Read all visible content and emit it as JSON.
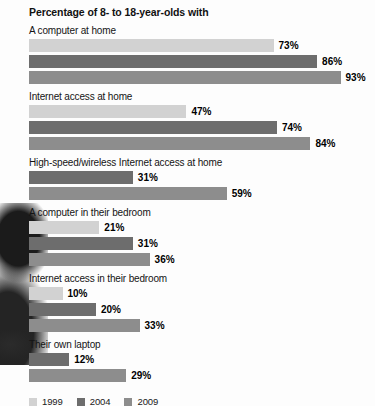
{
  "chart_data": {
    "type": "bar",
    "orientation": "horizontal",
    "title": "Percentage of 8- to 18-year-olds with",
    "xlabel": "",
    "ylabel": "",
    "xlim": [
      0,
      100
    ],
    "grid": false,
    "legend_position": "bottom-left",
    "categories": [
      "A computer at home",
      "Internet access at home",
      "High-speed/wireless Internet access at home",
      "A computer in their bedroom",
      "Internet access in their bedroom",
      "Their own laptop"
    ],
    "series": [
      {
        "name": "1999",
        "color": "#d2d2d2",
        "values": [
          73,
          47,
          null,
          21,
          10,
          null
        ]
      },
      {
        "name": "2004",
        "color": "#6d6d6d",
        "values": [
          86,
          74,
          31,
          31,
          20,
          12
        ]
      },
      {
        "name": "2009",
        "color": "#8d8d8d",
        "values": [
          93,
          84,
          59,
          36,
          33,
          29
        ]
      }
    ],
    "value_suffix": "%",
    "groups": [
      {
        "label": "A computer at home",
        "bars": [
          {
            "series": "1999",
            "value": 73,
            "label": "73%",
            "color": "#d2d2d2"
          },
          {
            "series": "2004",
            "value": 86,
            "label": "86%",
            "color": "#6d6d6d"
          },
          {
            "series": "2009",
            "value": 93,
            "label": "93%",
            "color": "#8d8d8d"
          }
        ]
      },
      {
        "label": "Internet access at home",
        "bars": [
          {
            "series": "1999",
            "value": 47,
            "label": "47%",
            "color": "#d2d2d2"
          },
          {
            "series": "2004",
            "value": 74,
            "label": "74%",
            "color": "#6d6d6d"
          },
          {
            "series": "2009",
            "value": 84,
            "label": "84%",
            "color": "#8d8d8d"
          }
        ]
      },
      {
        "label": "High-speed/wireless Internet access at home",
        "bars": [
          {
            "series": "2004",
            "value": 31,
            "label": "31%",
            "color": "#6d6d6d"
          },
          {
            "series": "2009",
            "value": 59,
            "label": "59%",
            "color": "#8d8d8d"
          }
        ]
      },
      {
        "label": "A computer in their bedroom",
        "bars": [
          {
            "series": "1999",
            "value": 21,
            "label": "21%",
            "color": "#d2d2d2"
          },
          {
            "series": "2004",
            "value": 31,
            "label": "31%",
            "color": "#6d6d6d"
          },
          {
            "series": "2009",
            "value": 36,
            "label": "36%",
            "color": "#8d8d8d"
          }
        ]
      },
      {
        "label": "Internet access in their bedroom",
        "bars": [
          {
            "series": "1999",
            "value": 10,
            "label": "10%",
            "color": "#d2d2d2"
          },
          {
            "series": "2004",
            "value": 20,
            "label": "20%",
            "color": "#6d6d6d"
          },
          {
            "series": "2009",
            "value": 33,
            "label": "33%",
            "color": "#8d8d8d"
          }
        ]
      },
      {
        "label": "Their own laptop",
        "bars": [
          {
            "series": "2004",
            "value": 12,
            "label": "12%",
            "color": "#6d6d6d"
          },
          {
            "series": "2009",
            "value": 29,
            "label": "29%",
            "color": "#8d8d8d"
          }
        ]
      }
    ],
    "legend": [
      {
        "name": "1999",
        "color": "#d2d2d2"
      },
      {
        "name": "2004",
        "color": "#6d6d6d"
      },
      {
        "name": "2009",
        "color": "#8d8d8d"
      }
    ]
  },
  "render": {
    "bar_start_x_px": 29,
    "px_per_percent": 3.35
  }
}
